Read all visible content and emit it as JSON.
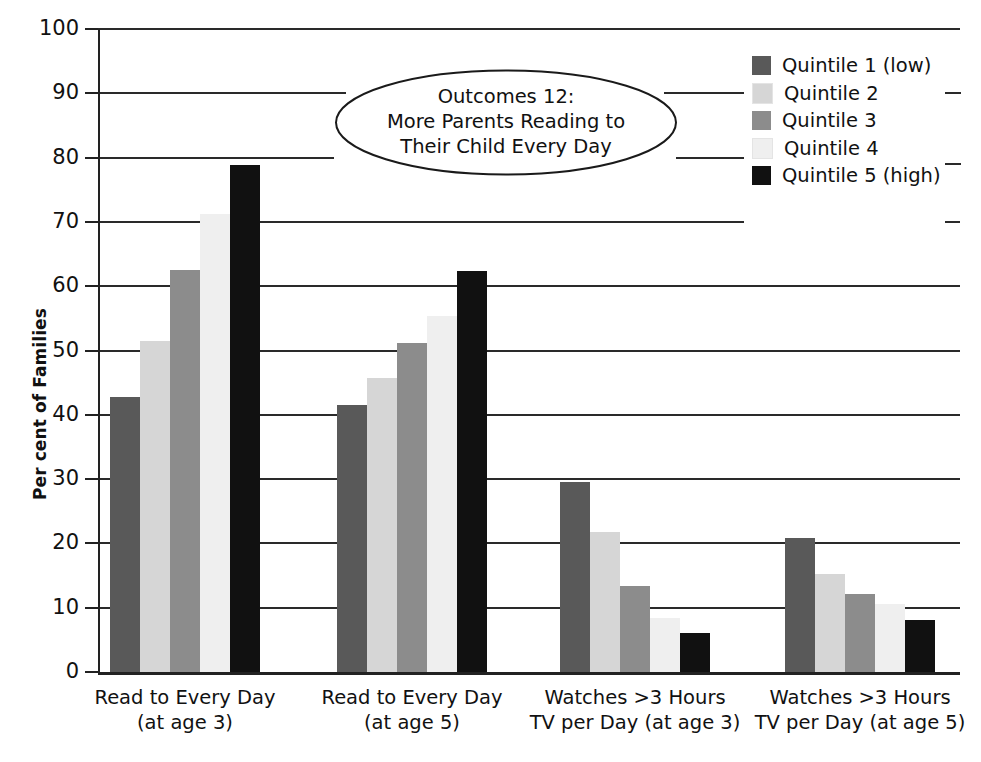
{
  "chart_data": {
    "type": "bar",
    "title_lines": [
      "Outcomes 12:",
      "More Parents Reading to",
      "Their Child Every Day"
    ],
    "xlabel": "",
    "ylabel": "Per cent of Families",
    "ylim": [
      0,
      100
    ],
    "ytick_step": 10,
    "yticks": [
      0,
      10,
      20,
      30,
      40,
      50,
      60,
      70,
      80,
      90,
      100
    ],
    "ytick_labels": [
      "0",
      "10",
      "20",
      "30",
      "40",
      "50",
      "60",
      "70",
      "80",
      "90",
      "100"
    ],
    "grid": true,
    "grid_axis": "y",
    "legend_position": "top-right",
    "categories": [
      "Read to Every Day\n(at age 3)",
      "Read to Every Day\n(at age 5)",
      "Watches >3 Hours\nTV per Day (at age 3)",
      "Watches >3 Hours\nTV per Day (at age 5)"
    ],
    "category_lines": [
      [
        "Read to Every Day",
        "(at age 3)"
      ],
      [
        "Read to Every Day",
        "(at age 5)"
      ],
      [
        "Watches >3 Hours",
        "TV per Day (at age 3)"
      ],
      [
        "Watches >3 Hours",
        "TV per Day (at age 5)"
      ]
    ],
    "series": [
      {
        "name": "Quintile 1 (low)",
        "color": "#595959",
        "values": [
          42.7,
          41.5,
          29.6,
          20.8
        ]
      },
      {
        "name": "Quintile 2",
        "color": "#d6d6d6",
        "values": [
          51.4,
          45.8,
          21.7,
          15.3
        ]
      },
      {
        "name": "Quintile 3",
        "color": "#8c8c8c",
        "values": [
          62.5,
          51.2,
          13.4,
          12.2
        ]
      },
      {
        "name": "Quintile 4",
        "color": "#efefef",
        "values": [
          71.2,
          55.4,
          8.4,
          10.6
        ]
      },
      {
        "name": "Quintile 5 (high)",
        "color": "#111111",
        "values": [
          78.8,
          62.3,
          6.0,
          8.1
        ]
      }
    ]
  },
  "legend": {
    "items": [
      {
        "label": "Quintile 1 (low)",
        "color": "#595959"
      },
      {
        "label": "Quintile 2",
        "color": "#d6d6d6"
      },
      {
        "label": "Quintile 3",
        "color": "#8c8c8c"
      },
      {
        "label": "Quintile 4",
        "color": "#efefef"
      },
      {
        "label": "Quintile 5 (high)",
        "color": "#111111"
      }
    ]
  },
  "axis": {
    "y_title": "Per cent of Families"
  },
  "colors": {
    "axis": "#222222",
    "grid": "#2a2a2a",
    "text": "#111111",
    "background": "#ffffff"
  }
}
